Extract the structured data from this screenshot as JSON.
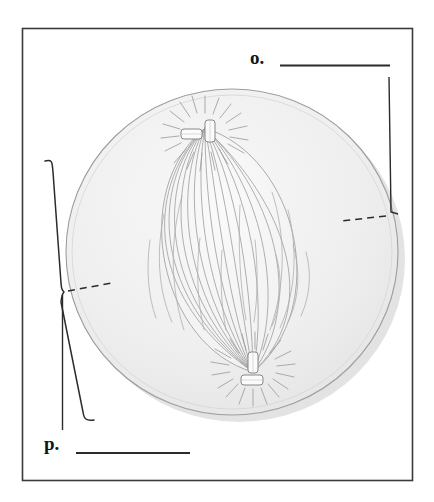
{
  "figure": {
    "kind": "biology-diagram",
    "frame": {
      "border_color": "#3a3a3a",
      "background_color": "#ffffff"
    },
    "cell": {
      "name": "cell-body",
      "fill_color": "#f0f0f0",
      "outline_color": "#9a9a9a",
      "shadow_color": "#d8d8d8",
      "center_x": 232,
      "center_y": 252,
      "radius_x": 166,
      "radius_y": 163
    },
    "spindle": {
      "name": "mitotic-spindle",
      "fill_color": "#f6f6f6",
      "outline_color": "#a9a9a9",
      "fiber_color": "#9f9f9f",
      "fiber_count": 26
    },
    "centrosomes": [
      {
        "name": "centrosome-top",
        "x": 205,
        "y": 128,
        "ray_count": 20,
        "centriole_fill": "#fbfbfb",
        "centriole_outline": "#8a8a8a"
      },
      {
        "name": "centrosome-bottom",
        "x": 253,
        "y": 372,
        "ray_count": 20,
        "centriole_fill": "#fbfbfb",
        "centriole_outline": "#8a8a8a"
      }
    ]
  },
  "labels": {
    "o": {
      "marker": "o.",
      "answer_line": "",
      "leader_style": "dashed",
      "points_to": "cell membrane / cytoplasm at right edge"
    },
    "p": {
      "marker": "p.",
      "answer_line": "",
      "leader_style": "brace-and-dashed",
      "points_to": "cytoplasm region at left of spindle"
    }
  }
}
